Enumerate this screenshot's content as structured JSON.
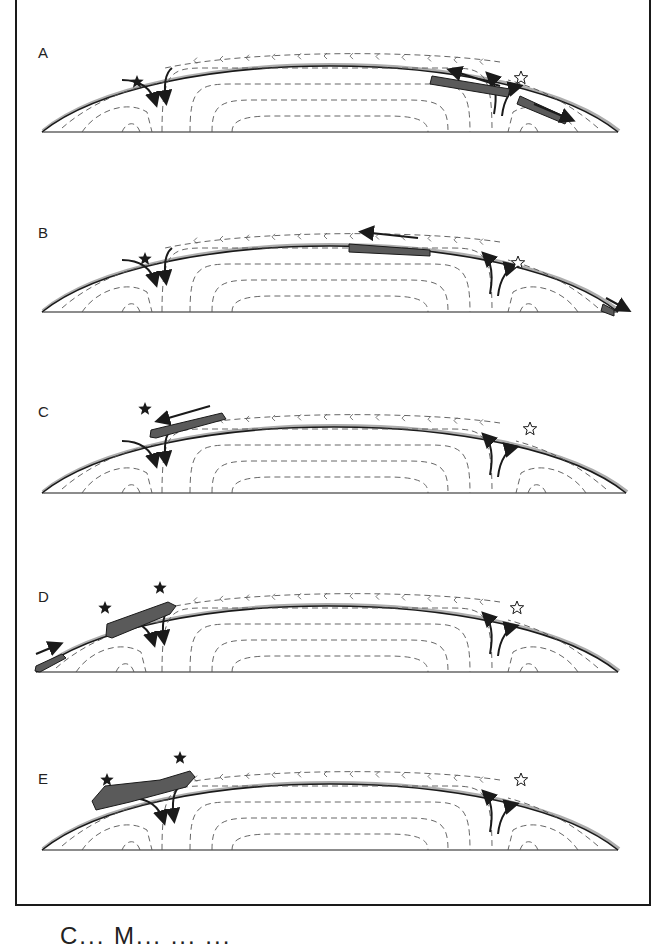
{
  "figure": {
    "caption_partial": "C... M... ... ...",
    "colors": {
      "line": "#1a1a1a",
      "plate_fill": "#5a5a5a",
      "crust_shade": "#8a8a8a",
      "dashed_flow": "#555555",
      "background": "#ffffff"
    }
  },
  "legend": {
    "filled_star": "active site (filled star)",
    "open_star": "inactive site (open star)"
  },
  "panels": [
    {
      "label": "A",
      "top": 20,
      "filled_stars": [
        [
          137,
          62
        ]
      ],
      "open_stars": [
        [
          521,
          58
        ]
      ],
      "plates": [
        {
          "d": "M432,56 L510,69 L508,77 L430,64 Z"
        },
        {
          "d": "M520,76 L568,98 L565,104 L517,84 Z"
        }
      ],
      "plate_arrows": [
        {
          "x1": 500,
          "y1": 66,
          "x2": 450,
          "y2": 50
        },
        {
          "x1": 534,
          "y1": 84,
          "x2": 572,
          "y2": 100
        }
      ]
    },
    {
      "label": "B",
      "top": 200,
      "filled_stars": [
        [
          145,
          59
        ]
      ],
      "open_stars": [
        [
          518,
          63
        ]
      ],
      "plates": [
        {
          "d": "M349,44 L430,50 L430,56 L349,52 Z"
        },
        {
          "d": "M603,104 L614,110 L614,116 L601,111 Z"
        }
      ],
      "plate_arrows": [
        {
          "x1": 418,
          "y1": 38,
          "x2": 362,
          "y2": 32
        },
        {
          "x1": 606,
          "y1": 98,
          "x2": 628,
          "y2": 110
        }
      ]
    },
    {
      "label": "C",
      "top": 383,
      "filled_stars": [
        [
          145,
          26
        ]
      ],
      "open_stars": [
        [
          530,
          46
        ]
      ],
      "plates": [
        {
          "d": "M151,47 L222,30 L226,36 L156,55 L150,54 Z"
        }
      ],
      "plate_arrows": [
        {
          "x1": 210,
          "y1": 23,
          "x2": 158,
          "y2": 38
        }
      ]
    },
    {
      "label": "D",
      "top": 560,
      "filled_stars": [
        [
          105,
          48
        ],
        [
          160,
          28
        ]
      ],
      "open_stars": [
        [
          517,
          48
        ]
      ],
      "plates": [
        {
          "d": "M107,64 L168,42 L176,46 L170,54 L112,78 L106,76 Z"
        },
        {
          "d": "M36,106 L62,94 L66,98 L40,112 L35,111 Z"
        }
      ],
      "plate_arrows": [
        {
          "x1": 36,
          "y1": 94,
          "x2": 60,
          "y2": 84
        }
      ]
    },
    {
      "label": "E",
      "top": 740,
      "filled_stars": [
        [
          107,
          40
        ],
        [
          180,
          18
        ]
      ],
      "open_stars": [
        [
          521,
          40
        ]
      ],
      "plates": [
        {
          "d": "M92,61 L105,46 L160,40 L190,31 L195,37 L186,47 L130,62 L96,70 Z"
        }
      ],
      "plate_arrows": []
    }
  ]
}
